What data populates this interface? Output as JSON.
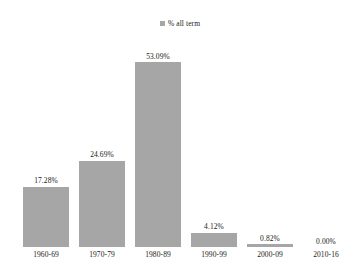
{
  "legend": {
    "marker": "legend-square",
    "label": "% all term",
    "color": "#a6a6a6",
    "position": "top-center"
  },
  "colors": {
    "bar": "#a6a6a6",
    "text": "#1a1a1a",
    "background": "#ffffff"
  },
  "chart_data": {
    "type": "bar",
    "title": "",
    "subtitle": "",
    "xlabel": "",
    "ylabel": "",
    "grid": false,
    "legend_position": "top-center",
    "ylim": [
      0,
      53.09
    ],
    "categories": [
      "1960-69",
      "1970-79",
      "1980-89",
      "1990-99",
      "2000-09",
      "2010-16"
    ],
    "values": [
      17.28,
      24.69,
      53.09,
      4.12,
      0.82,
      0.0
    ],
    "value_labels": [
      "17.28%",
      "24.69%",
      "53.09%",
      "4.12%",
      "0.82%",
      "0.00%"
    ],
    "series": [
      {
        "name": "% all term",
        "values": [
          17.28,
          24.69,
          53.09,
          4.12,
          0.82,
          0.0
        ]
      }
    ]
  }
}
